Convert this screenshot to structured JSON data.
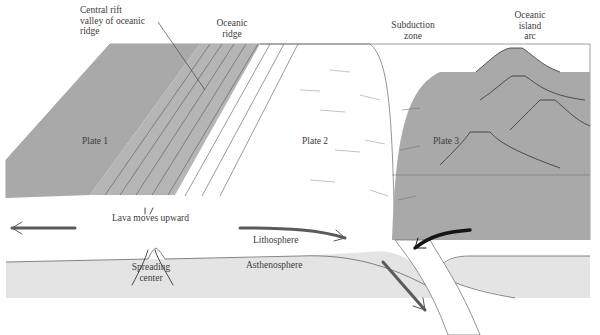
{
  "figure": {
    "colors": {
      "plate_dark": "#a9a9a9",
      "plate_light": "#ffffff",
      "asthenosphere": "#e4e4e4",
      "arrow_gray": "#5a5a5a",
      "arrow_black": "#151515",
      "line": "#555555"
    }
  },
  "labels": {
    "rift_valley": [
      "Central rift",
      "valley of oceanic",
      "ridge"
    ],
    "oceanic_ridge": [
      "Oceanic",
      "ridge"
    ],
    "subduction_zone": [
      "Subduction",
      "zone"
    ],
    "island_arc": [
      "Oceanic",
      "island",
      "arc"
    ],
    "plate1": "Plate 1",
    "plate2": "Plate 2",
    "plate3": "Plate 3",
    "lava": "Lava moves upward",
    "lithosphere": "Lithosphere",
    "spreading_center": [
      "Spreading",
      "center"
    ],
    "asthenosphere": "Asthenosphere"
  },
  "arrows": [
    {
      "name": "plate1-motion",
      "direction": "left"
    },
    {
      "name": "plate2-motion",
      "direction": "right-down"
    },
    {
      "name": "plate3-motion",
      "direction": "left-down"
    },
    {
      "name": "subducting-slab-motion",
      "direction": "down-right"
    },
    {
      "name": "lava-upwelling",
      "direction": "up"
    }
  ]
}
